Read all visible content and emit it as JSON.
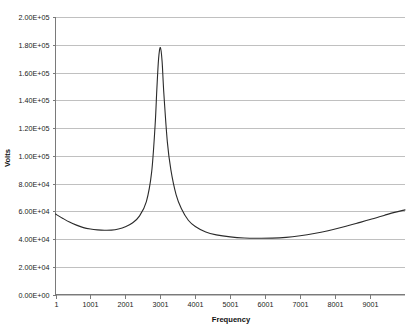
{
  "chart_data": {
    "type": "line",
    "title": "",
    "xlabel": "Frequency",
    "ylabel": "Volts",
    "xlim": [
      1,
      10001
    ],
    "ylim": [
      0,
      200000
    ],
    "grid": true,
    "grid_axis": "y",
    "legend": false,
    "legend_position": "none",
    "x_tick_labels": [
      "1",
      "1001",
      "2001",
      "3001",
      "4001",
      "5001",
      "6001",
      "7001",
      "8001",
      "9001"
    ],
    "x_tick_values": [
      1,
      1001,
      2001,
      3001,
      4001,
      5001,
      6001,
      7001,
      8001,
      9001
    ],
    "y_tick_labels": [
      "0.00E+00",
      "2.00E+04",
      "4.00E+04",
      "6.00E+04",
      "8.00E+04",
      "1.00E+05",
      "1.20E+05",
      "1.40E+05",
      "1.60E+05",
      "1.80E+05",
      "2.00E+05"
    ],
    "y_tick_values": [
      0,
      20000,
      40000,
      60000,
      80000,
      100000,
      120000,
      140000,
      160000,
      180000,
      200000
    ],
    "series": [
      {
        "name": "Volts vs Frequency",
        "color": "#2b2b2b",
        "x": [
          1,
          201,
          401,
          601,
          801,
          1001,
          1201,
          1401,
          1601,
          1801,
          2001,
          2201,
          2401,
          2601,
          2751,
          2851,
          2901,
          2951,
          3001,
          3051,
          3101,
          3201,
          3301,
          3451,
          3601,
          3801,
          4001,
          4301,
          4601,
          5001,
          5401,
          5801,
          6201,
          6601,
          7001,
          7401,
          7801,
          8201,
          8601,
          9001,
          9401,
          9701,
          10001
        ],
        "y": [
          58000,
          55000,
          52200,
          50000,
          48200,
          47200,
          46600,
          46300,
          46400,
          47200,
          48800,
          51500,
          56500,
          67000,
          88000,
          122000,
          148000,
          170000,
          178000,
          168000,
          145000,
          110000,
          90000,
          72000,
          62000,
          53500,
          49000,
          45000,
          43000,
          41500,
          40700,
          40500,
          40600,
          41200,
          42400,
          44000,
          46000,
          48400,
          51200,
          54000,
          57000,
          59200,
          61000
        ]
      }
    ],
    "annotations": [
      {
        "label": "resonant-peak",
        "x": 3001,
        "y": 178000
      }
    ]
  },
  "axis_titles": {
    "x": "Frequency",
    "y": "Volts"
  },
  "colors": {
    "background": "#ffffff",
    "gridline": "#b9b9b9",
    "axis": "#7a7a7a",
    "series": "#2b2b2b",
    "text": "#1b1b1b"
  }
}
